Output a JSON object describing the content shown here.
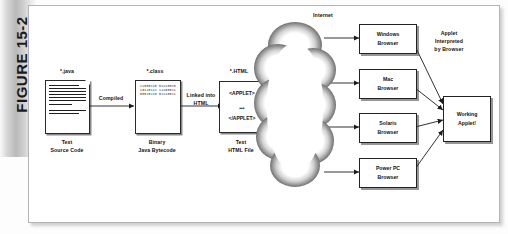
{
  "figure": {
    "label": "FIGURE 15-2"
  },
  "diagram": {
    "internet_label": "Internet",
    "nodes": {
      "java_file": {
        "top_label": "*.java",
        "bottom_label": "Text\nSource Code",
        "type": "text-document"
      },
      "class_file": {
        "top_label": "*.class",
        "bottom_label": "Binary\nJava Bytecode",
        "type": "binary-document",
        "bits": "11000110\n01110010\n10110111\n11100011\n00010110\n01110011"
      },
      "html_file": {
        "top_label": "*.HTML",
        "bottom_label": "Text\nHTML File",
        "type": "html-document",
        "code_open": "<APPLET>",
        "code_ellipsis": "•••",
        "code_close": "</APPLET>"
      },
      "working_applet": {
        "label": "Working\nApplet!"
      }
    },
    "edges": {
      "compiled": "Compiled",
      "linked": "Linked into\nHTML",
      "interpreted": "Applet\nInterpreted\nby Browser"
    },
    "browsers": [
      {
        "label": "Windows\nBrowser"
      },
      {
        "label": "Mac\nBrowser"
      },
      {
        "label": "Solaris\nBrowser"
      },
      {
        "label": "Power PC\nBrowser"
      }
    ]
  },
  "colors": {
    "band_gray": "#b9b9b9",
    "ink": "#111111",
    "canvas": "#ffffff",
    "border": "#222222"
  }
}
